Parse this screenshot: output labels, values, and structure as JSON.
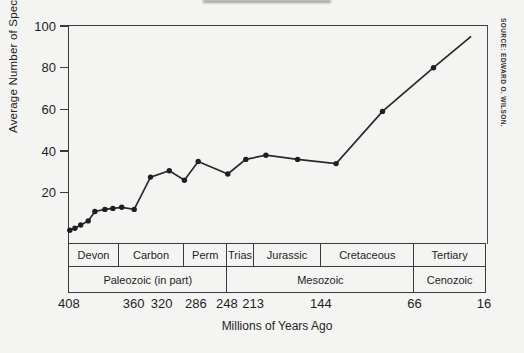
{
  "figure": {
    "y_axis_title": "Average Number of Species per Flora Ecosystem",
    "x_axis_title": "Millions of Years Ago",
    "source_note": "SOURCE: EDWARD O. WILSON."
  },
  "colors": {
    "background": "#f4f4f2",
    "ink": "#2a2a2a",
    "line": "#2a2a2a",
    "marker": "#1f1f1f"
  },
  "chart_data": {
    "type": "line",
    "title": "",
    "xlabel": "Millions of Years Ago",
    "ylabel": "Average Number of Species per Flora Ecosystem",
    "x_direction": "geologic time, decreasing left to right",
    "ylim": [
      0,
      100
    ],
    "y_axis_bottom_value": -4.6,
    "grid": "off",
    "y_ticks": [
      100,
      80,
      60,
      40,
      20
    ],
    "x_ticks": [
      {
        "ma": 408,
        "fx": 0.002
      },
      {
        "ma": 360,
        "fx": 0.157
      },
      {
        "ma": 320,
        "fx": 0.224
      },
      {
        "ma": 286,
        "fx": 0.306
      },
      {
        "ma": 248,
        "fx": 0.38
      },
      {
        "ma": 213,
        "fx": 0.443
      },
      {
        "ma": 144,
        "fx": 0.605
      },
      {
        "ma": 66,
        "fx": 0.829
      },
      {
        "ma": 16,
        "fx": 0.995
      }
    ],
    "series": [
      {
        "name": "Average number of species per flora ecosystem",
        "points": [
          {
            "ma": 408,
            "y": 2,
            "fx": 0.002,
            "dot": true
          },
          {
            "ma": 404,
            "y": 3,
            "fx": 0.014,
            "dot": true
          },
          {
            "ma": 400,
            "y": 4.5,
            "fx": 0.028,
            "dot": true
          },
          {
            "ma": 393,
            "y": 6.5,
            "fx": 0.046,
            "dot": true
          },
          {
            "ma": 388,
            "y": 11,
            "fx": 0.062,
            "dot": true
          },
          {
            "ma": 381,
            "y": 12,
            "fx": 0.086,
            "dot": true
          },
          {
            "ma": 375,
            "y": 12.5,
            "fx": 0.105,
            "dot": true
          },
          {
            "ma": 368,
            "y": 13,
            "fx": 0.126,
            "dot": true
          },
          {
            "ma": 360,
            "y": 12,
            "fx": 0.156,
            "dot": true
          },
          {
            "ma": 337,
            "y": 27.5,
            "fx": 0.195,
            "dot": true
          },
          {
            "ma": 313,
            "y": 30.5,
            "fx": 0.24,
            "dot": true
          },
          {
            "ma": 298,
            "y": 26,
            "fx": 0.276,
            "dot": true
          },
          {
            "ma": 284,
            "y": 35,
            "fx": 0.309,
            "dot": true
          },
          {
            "ma": 248,
            "y": 29,
            "fx": 0.38,
            "dot": true
          },
          {
            "ma": 224,
            "y": 36,
            "fx": 0.423,
            "dot": true
          },
          {
            "ma": 200,
            "y": 38,
            "fx": 0.471,
            "dot": true
          },
          {
            "ma": 169,
            "y": 36,
            "fx": 0.547,
            "dot": true
          },
          {
            "ma": 131,
            "y": 34,
            "fx": 0.639,
            "dot": true
          },
          {
            "ma": 94,
            "y": 59,
            "fx": 0.75,
            "dot": true
          },
          {
            "ma": 53,
            "y": 80,
            "fx": 0.872,
            "dot": true
          },
          {
            "ma": 25,
            "y": 95,
            "fx": 0.962,
            "dot": false
          }
        ]
      }
    ],
    "periods": [
      {
        "label": "Devon",
        "f0": 0.0,
        "f1": 0.12
      },
      {
        "label": "Carbon",
        "f0": 0.12,
        "f1": 0.276
      },
      {
        "label": "Perm",
        "f0": 0.276,
        "f1": 0.38
      },
      {
        "label": "Trias",
        "f0": 0.38,
        "f1": 0.443
      },
      {
        "label": "Jurassic",
        "f0": 0.443,
        "f1": 0.605
      },
      {
        "label": "Cretaceous",
        "f0": 0.605,
        "f1": 0.828
      },
      {
        "label": "Tertiary",
        "f0": 0.828,
        "f1": 1.0
      }
    ],
    "eras": [
      {
        "label": "Paleozoic (in part)",
        "f0": 0.0,
        "f1": 0.38
      },
      {
        "label": "Mesozoic",
        "f0": 0.38,
        "f1": 0.828
      },
      {
        "label": "Cenozoic",
        "f0": 0.828,
        "f1": 1.0
      }
    ]
  }
}
